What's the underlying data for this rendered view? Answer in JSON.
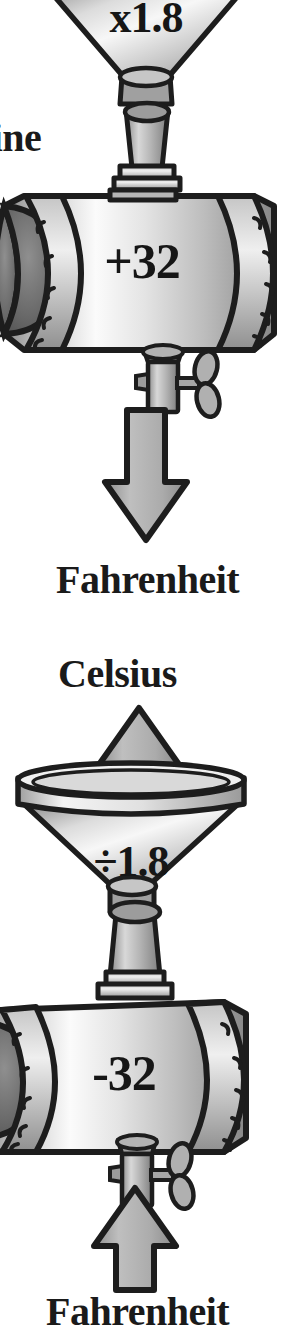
{
  "figure": {
    "type": "process-diagram",
    "style": "grayscale line art illustration",
    "ink_color": "#1a1a1a",
    "metal_light": "#f2f2f2",
    "metal_mid": "#b9b9b9",
    "metal_dark": "#6f6f6f",
    "arrow_fill": "#a8a8a8"
  },
  "machines": [
    {
      "name": "celsius-to-fahrenheit-machine",
      "caption_cut_off": "hine",
      "funnel_operation": "x1.8",
      "cylinder_operation": "+32",
      "output_label": "Fahrenheit",
      "flow_direction": "downward",
      "valve": "handwheel-valve"
    },
    {
      "name": "fahrenheit-to-celsius-machine",
      "output_label": "Celsius",
      "funnel_operation": "÷1.8",
      "cylinder_operation": "-32",
      "input_label": "Fahrenheit",
      "flow_direction": "upward",
      "valve": "handwheel-valve"
    }
  ],
  "labels": {
    "machine_cut": "hine",
    "fahrenheit_top": "Fahrenheit",
    "celsius": "Celsius",
    "fahrenheit_bottom": "Fahrenheit"
  },
  "operations": {
    "multiply": "x1.8",
    "add": "+32",
    "divide": "÷1.8",
    "subtract": "-32"
  }
}
